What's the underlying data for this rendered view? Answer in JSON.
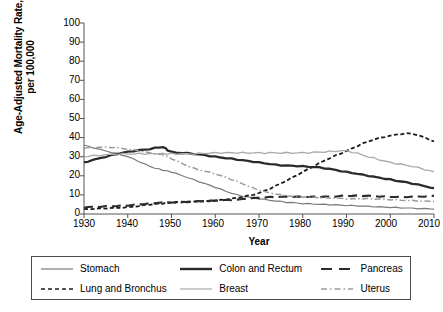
{
  "chart_data": {
    "type": "line",
    "title": "",
    "xlabel": "Year",
    "ylabel": "Age-Adjusted Mortality Rate, per 100,000",
    "ylabel_line1": "Age-Adjusted Mortality Rate,",
    "ylabel_line2": "per 100,000",
    "xlim": [
      1930,
      2010
    ],
    "ylim": [
      0,
      100
    ],
    "grid": false,
    "legend_position": "below-plot",
    "xticks": [
      1930,
      1940,
      1950,
      1960,
      1970,
      1980,
      1990,
      2000,
      2010
    ],
    "yticks": [
      0,
      10,
      20,
      30,
      40,
      50,
      60,
      70,
      80,
      90,
      100
    ],
    "x": [
      1930,
      1935,
      1940,
      1945,
      1948,
      1950,
      1955,
      1960,
      1965,
      1970,
      1975,
      1980,
      1985,
      1990,
      1995,
      2000,
      2005,
      2010
    ],
    "series": [
      {
        "name": "Stomach",
        "style": "solid-thin-gray",
        "color": "#7a7a7a",
        "values": [
          36,
          33,
          30,
          25,
          23,
          22,
          18,
          14,
          10,
          8,
          6.5,
          5.5,
          5,
          4.5,
          4,
          3.5,
          3,
          2.6
        ]
      },
      {
        "name": "Lung and Bronchus",
        "style": "dashed-black",
        "color": "#1a1a1a",
        "values": [
          2.5,
          3,
          3.5,
          5,
          5.5,
          6,
          6.5,
          7,
          8.5,
          11,
          16,
          22,
          28,
          33,
          38,
          41,
          42,
          38
        ]
      },
      {
        "name": "Colon and Rectum",
        "style": "solid-thick-dark",
        "color": "#2b2b2b",
        "values": [
          27,
          30,
          32.5,
          34,
          35,
          32.5,
          31.5,
          30,
          28.5,
          27,
          25.5,
          25,
          24,
          22,
          20,
          18,
          16,
          13.5
        ]
      },
      {
        "name": "Breast",
        "style": "solid-thin-lightgray",
        "color": "#a8a8a8",
        "values": [
          30,
          31,
          31.5,
          31.5,
          31.5,
          31.5,
          31.5,
          32,
          32,
          32,
          32,
          32,
          32.5,
          33,
          30,
          27,
          25,
          22
        ]
      },
      {
        "name": "Pancreas",
        "style": "longdash-dark",
        "color": "#2b2b2b",
        "values": [
          3.5,
          4,
          4.5,
          5.5,
          6,
          6,
          6.5,
          7,
          7.5,
          8.5,
          9,
          9,
          9,
          9.5,
          9.5,
          9,
          9,
          9.5
        ]
      },
      {
        "name": "Uterus",
        "style": "dashdot-gray",
        "color": "#9a9a9a",
        "values": [
          34.5,
          35,
          34,
          32,
          31,
          29,
          24,
          21,
          17,
          12.5,
          10,
          9,
          8.5,
          8,
          8,
          7.5,
          7,
          6.5
        ]
      }
    ]
  },
  "axes": {
    "x_tick_labels": [
      "1930",
      "1940",
      "1950",
      "1960",
      "1970",
      "1980",
      "1990",
      "2000",
      "2010"
    ],
    "y_tick_labels": [
      "100",
      "90",
      "80",
      "70",
      "60",
      "50",
      "40",
      "30",
      "20",
      "10",
      "0"
    ]
  },
  "legend": {
    "entries": [
      {
        "label": "Stomach",
        "style": "solid-thin-gray"
      },
      {
        "label": "Colon and Rectum",
        "style": "solid-thick-dark"
      },
      {
        "label": "Pancreas",
        "style": "longdash-dark"
      },
      {
        "label": "Lung and Bronchus",
        "style": "dashed-black"
      },
      {
        "label": "Breast",
        "style": "solid-thin-lightgray"
      },
      {
        "label": "Uterus",
        "style": "dashdot-gray"
      }
    ]
  }
}
